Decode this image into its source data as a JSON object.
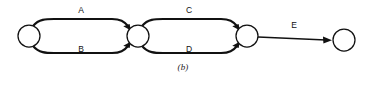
{
  "figure": {
    "caption": "(b)",
    "type": "activity-on-arc network diagram",
    "stroke_color": "#111111",
    "background_color": "#ffffff"
  },
  "nodes": [
    {
      "id": "node-1",
      "label": "",
      "cx": 29,
      "cy": 36,
      "r": 11
    },
    {
      "id": "node-2",
      "label": "",
      "cx": 138,
      "cy": 36,
      "r": 11
    },
    {
      "id": "node-3",
      "label": "",
      "cx": 247,
      "cy": 36,
      "r": 11
    },
    {
      "id": "node-4",
      "label": "",
      "cx": 344,
      "cy": 40,
      "r": 11
    }
  ],
  "arcs": [
    {
      "id": "arc-a",
      "label": "A",
      "from": "node-1",
      "to": "node-2",
      "shape": "upper-curve",
      "label_x": 81,
      "label_y": 11
    },
    {
      "id": "arc-b",
      "label": "B",
      "from": "node-1",
      "to": "node-2",
      "shape": "lower-curve",
      "label_x": 81,
      "label_y": 50
    },
    {
      "id": "arc-c",
      "label": "C",
      "from": "node-2",
      "to": "node-3",
      "shape": "upper-curve",
      "label_x": 189,
      "label_y": 11
    },
    {
      "id": "arc-d",
      "label": "D",
      "from": "node-2",
      "to": "node-3",
      "shape": "lower-curve",
      "label_x": 189,
      "label_y": 50
    },
    {
      "id": "arc-e",
      "label": "E",
      "from": "node-3",
      "to": "node-4",
      "shape": "straight",
      "label_x": 294,
      "label_y": 26
    }
  ]
}
